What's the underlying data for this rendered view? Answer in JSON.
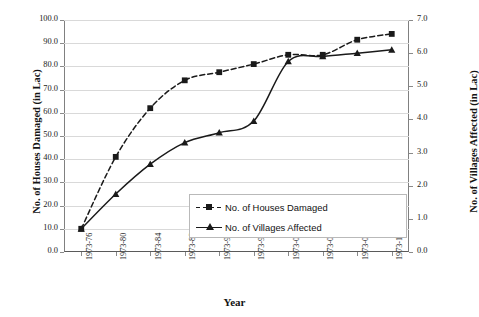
{
  "chart_data": {
    "type": "line",
    "title": "",
    "xlabel": "Year",
    "categories": [
      "1973-76",
      "1973-80",
      "1973-84",
      "1973-88",
      "1973-92",
      "1973-96",
      "1973-00",
      "1973-04",
      "1973-08",
      "1973-12"
    ],
    "grid": true,
    "legend_position": "inside-lower-center",
    "axes": {
      "left": {
        "label": "No. of Houses Damaged (in Lac)",
        "ylim": [
          0.0,
          100.0
        ],
        "step": 10.0,
        "ticks": [
          "0.0",
          "10.0",
          "20.0",
          "30.0",
          "40.0",
          "50.0",
          "60.0",
          "70.0",
          "80.0",
          "90.0",
          "100.0"
        ]
      },
      "right": {
        "label": "No. of Villages Affected (in Lac)",
        "ylim": [
          0.0,
          7.0
        ],
        "step": 1.0,
        "ticks": [
          "0.0",
          "1.0",
          "2.0",
          "3.0",
          "4.0",
          "5.0",
          "6.0",
          "7.0"
        ]
      }
    },
    "series": [
      {
        "name": "No. of Houses Damaged",
        "axis": "left",
        "style": "dashed",
        "marker": "square",
        "color": "#1a1a1a",
        "values": [
          10.0,
          41.0,
          62.0,
          74.0,
          77.5,
          81.0,
          85.0,
          85.0,
          91.5,
          94.0
        ]
      },
      {
        "name": "No. of Villages Affected",
        "axis": "right",
        "style": "solid",
        "marker": "triangle",
        "color": "#1a1a1a",
        "values": [
          0.7,
          1.75,
          2.65,
          3.3,
          3.6,
          3.95,
          5.75,
          5.9,
          6.0,
          6.1
        ]
      }
    ]
  },
  "legend": {
    "items": [
      {
        "label": "No. of Houses Damaged"
      },
      {
        "label": "No. of Villages Affected"
      }
    ]
  }
}
